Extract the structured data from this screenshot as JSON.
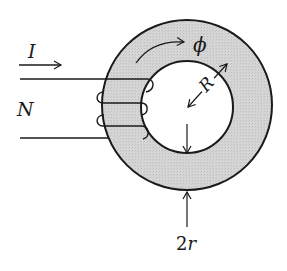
{
  "diagram": {
    "type": "toroidal-coil",
    "labels": {
      "current": "I",
      "turns": "N",
      "flux": "ϕ",
      "radius": "R",
      "diameter": "2r"
    },
    "colors": {
      "core_fill": "#d4d4d4",
      "stroke": "#1a1a1a",
      "background": "#ffffff"
    },
    "geometry": {
      "center": [
        187,
        105
      ],
      "outer_radius": 85,
      "inner_radius": 46
    }
  }
}
